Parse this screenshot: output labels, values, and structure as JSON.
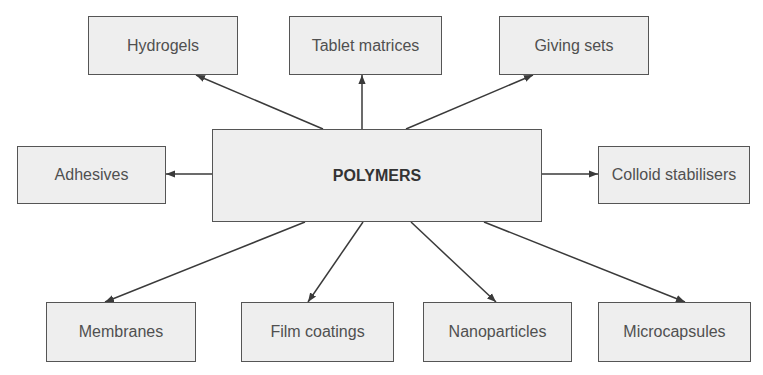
{
  "diagram": {
    "center": {
      "id": "polymers",
      "label": "POLYMERS",
      "box": [
        212,
        129,
        330,
        93
      ]
    },
    "nodes": [
      {
        "id": "hydrogels",
        "label": "Hydrogels",
        "box": [
          88,
          16,
          150,
          59
        ]
      },
      {
        "id": "tablet-matrices",
        "label": "Tablet matrices",
        "box": [
          289,
          16,
          153,
          59
        ]
      },
      {
        "id": "giving-sets",
        "label": "Giving sets",
        "box": [
          499,
          16,
          150,
          59
        ]
      },
      {
        "id": "adhesives",
        "label": "Adhesives",
        "box": [
          17,
          146,
          149,
          58
        ]
      },
      {
        "id": "colloid-stabilisers",
        "label": "Colloid stabilisers",
        "box": [
          598,
          146,
          152,
          58
        ]
      },
      {
        "id": "membranes",
        "label": "Membranes",
        "box": [
          46,
          302,
          150,
          60
        ]
      },
      {
        "id": "film-coatings",
        "label": "Film coatings",
        "box": [
          241,
          302,
          153,
          60
        ]
      },
      {
        "id": "nanoparticles",
        "label": "Nanoparticles",
        "box": [
          423,
          302,
          149,
          60
        ]
      },
      {
        "id": "microcapsules",
        "label": "Microcapsules",
        "box": [
          598,
          302,
          153,
          60
        ]
      }
    ],
    "edges": [
      {
        "from": "polymers",
        "to": "hydrogels",
        "line": [
          323,
          129,
          196,
          75
        ]
      },
      {
        "from": "polymers",
        "to": "tablet-matrices",
        "line": [
          362,
          129,
          362,
          75
        ]
      },
      {
        "from": "polymers",
        "to": "giving-sets",
        "line": [
          406,
          129,
          533,
          75
        ]
      },
      {
        "from": "polymers",
        "to": "adhesives",
        "line": [
          212,
          174,
          166,
          174
        ]
      },
      {
        "from": "polymers",
        "to": "colloid-stabilisers",
        "line": [
          542,
          174,
          598,
          174
        ]
      },
      {
        "from": "polymers",
        "to": "membranes",
        "line": [
          305,
          222,
          105,
          302
        ]
      },
      {
        "from": "polymers",
        "to": "film-coatings",
        "line": [
          363,
          222,
          308,
          302
        ]
      },
      {
        "from": "polymers",
        "to": "nanoparticles",
        "line": [
          411,
          222,
          496,
          302
        ]
      },
      {
        "from": "polymers",
        "to": "microcapsules",
        "line": [
          484,
          222,
          685,
          302
        ]
      }
    ]
  }
}
